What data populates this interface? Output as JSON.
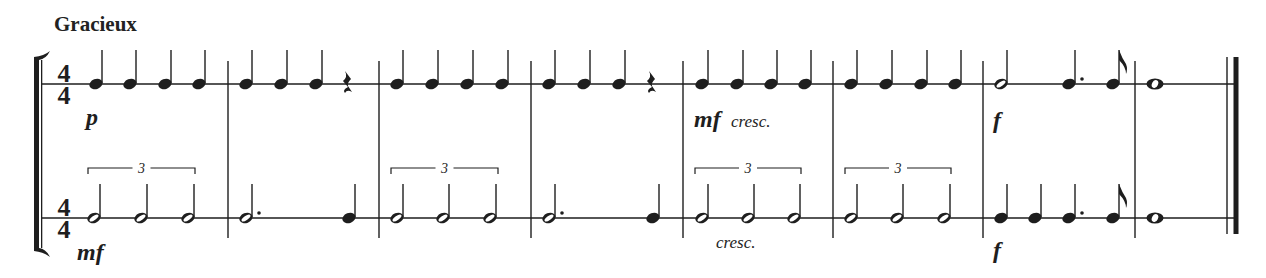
{
  "score": {
    "tempo_marking": "Gracieux",
    "time_signature": {
      "numerator": "4",
      "denominator": "4"
    },
    "ink_color": "#1e1e1e",
    "staves": [
      {
        "name": "upper-rhythm-staff",
        "line_y": 84,
        "measures": [
          {
            "number": 1,
            "notes": [
              {
                "type": "quarter",
                "x": 96
              },
              {
                "type": "quarter",
                "x": 130
              },
              {
                "type": "quarter",
                "x": 165
              },
              {
                "type": "quarter",
                "x": 199
              }
            ],
            "dynamics": [
              {
                "text": "p",
                "x": 86,
                "y": 125,
                "style": "dyn"
              }
            ]
          },
          {
            "number": 2,
            "notes": [
              {
                "type": "quarter",
                "x": 246
              },
              {
                "type": "quarter",
                "x": 281
              },
              {
                "type": "quarter",
                "x": 316
              },
              {
                "type": "quarter-rest",
                "x": 347
              }
            ]
          },
          {
            "number": 3,
            "notes": [
              {
                "type": "quarter",
                "x": 397
              },
              {
                "type": "quarter",
                "x": 432
              },
              {
                "type": "quarter",
                "x": 467
              },
              {
                "type": "quarter",
                "x": 502
              }
            ]
          },
          {
            "number": 4,
            "notes": [
              {
                "type": "quarter",
                "x": 549
              },
              {
                "type": "quarter",
                "x": 584
              },
              {
                "type": "quarter",
                "x": 619
              },
              {
                "type": "quarter-rest",
                "x": 651
              }
            ]
          },
          {
            "number": 5,
            "notes": [
              {
                "type": "quarter",
                "x": 702
              },
              {
                "type": "quarter",
                "x": 737
              },
              {
                "type": "quarter",
                "x": 771
              },
              {
                "type": "quarter",
                "x": 805
              }
            ],
            "dynamics": [
              {
                "text": "mf",
                "x": 694,
                "y": 127,
                "style": "dyn"
              },
              {
                "text": "cresc.",
                "x": 731,
                "y": 127,
                "style": "expr"
              }
            ]
          },
          {
            "number": 6,
            "notes": [
              {
                "type": "quarter",
                "x": 851
              },
              {
                "type": "quarter",
                "x": 886
              },
              {
                "type": "quarter",
                "x": 921
              },
              {
                "type": "quarter",
                "x": 955
              }
            ]
          },
          {
            "number": 7,
            "notes": [
              {
                "type": "half",
                "x": 1001
              },
              {
                "type": "dotted-quarter",
                "x": 1069
              },
              {
                "type": "eighth",
                "x": 1113
              }
            ],
            "dynamics": [
              {
                "text": "f",
                "x": 993,
                "y": 128,
                "style": "dyn"
              }
            ]
          },
          {
            "number": 8,
            "notes": [
              {
                "type": "whole",
                "x": 1155
              }
            ]
          }
        ]
      },
      {
        "name": "lower-rhythm-staff",
        "line_y": 218,
        "measures": [
          {
            "number": 1,
            "notes": [
              {
                "type": "half",
                "x": 94
              },
              {
                "type": "half",
                "x": 141
              },
              {
                "type": "half",
                "x": 188
              }
            ],
            "tuplet": {
              "label": "3",
              "x1": 88,
              "x2": 195
            },
            "dynamics": [
              {
                "text": "mf",
                "x": 77,
                "y": 260,
                "style": "dyn"
              }
            ]
          },
          {
            "number": 2,
            "notes": [
              {
                "type": "dotted-half",
                "x": 246
              },
              {
                "type": "quarter",
                "x": 349
              }
            ]
          },
          {
            "number": 3,
            "notes": [
              {
                "type": "half",
                "x": 397
              },
              {
                "type": "half",
                "x": 443
              },
              {
                "type": "half",
                "x": 490
              }
            ],
            "tuplet": {
              "label": "3",
              "x1": 391,
              "x2": 498
            }
          },
          {
            "number": 4,
            "notes": [
              {
                "type": "dotted-half",
                "x": 549
              },
              {
                "type": "quarter",
                "x": 653
              }
            ]
          },
          {
            "number": 5,
            "notes": [
              {
                "type": "half",
                "x": 702
              },
              {
                "type": "half",
                "x": 748
              },
              {
                "type": "half",
                "x": 794
              }
            ],
            "tuplet": {
              "label": "3",
              "x1": 695,
              "x2": 801
            },
            "dynamics": [
              {
                "text": "cresc.",
                "x": 716,
                "y": 248,
                "style": "expr"
              }
            ]
          },
          {
            "number": 6,
            "notes": [
              {
                "type": "half",
                "x": 851
              },
              {
                "type": "half",
                "x": 897
              },
              {
                "type": "half",
                "x": 944
              }
            ],
            "tuplet": {
              "label": "3",
              "x1": 845,
              "x2": 951
            }
          },
          {
            "number": 7,
            "notes": [
              {
                "type": "quarter",
                "x": 1001
              },
              {
                "type": "quarter",
                "x": 1035
              },
              {
                "type": "dotted-quarter",
                "x": 1069
              },
              {
                "type": "eighth",
                "x": 1113
              }
            ],
            "dynamics": [
              {
                "text": "f",
                "x": 993,
                "y": 258,
                "style": "dyn"
              }
            ]
          },
          {
            "number": 8,
            "notes": [
              {
                "type": "whole",
                "x": 1155
              }
            ]
          }
        ]
      }
    ],
    "barlines_x": [
      228,
      379,
      531,
      683,
      833,
      983,
      1135
    ],
    "final_barline": {
      "thin_x": 1227,
      "thick_x": 1236
    }
  }
}
